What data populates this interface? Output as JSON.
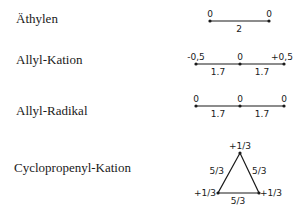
{
  "molecules": [
    {
      "name": "Äthylen",
      "charges": [
        "0",
        "0"
      ],
      "bond_orders": [
        "2"
      ]
    },
    {
      "name": "Allyl-Kation",
      "charges": [
        "-0,5",
        "0",
        "+0,5"
      ],
      "bond_orders": [
        "1.7",
        "1.7"
      ]
    },
    {
      "name": "Allyl-Radikal",
      "charges": [
        "0",
        "0",
        "0"
      ],
      "bond_orders": [
        "1.7",
        "1.7"
      ]
    },
    {
      "name": "Cyclopropenyl-Kation",
      "charges": [
        "+1/3",
        "+1/3",
        "+1/3"
      ],
      "bond_orders": [
        "5/3",
        "5/3",
        "5/3"
      ]
    }
  ],
  "colors": {
    "ink": "#1a1a1a",
    "background": "#ffffff"
  }
}
